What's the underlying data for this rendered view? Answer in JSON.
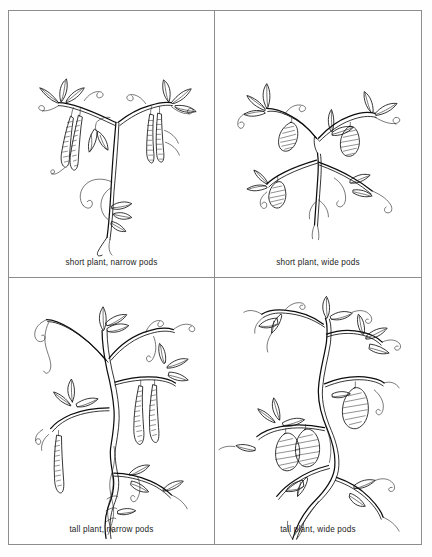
{
  "figure": {
    "background_color": "#ffffff",
    "ink_color": "#111111",
    "border_color": "#8d8d8d",
    "layout": "2x2 grid of framed panels"
  },
  "panels": [
    {
      "id": "short-narrow",
      "caption": "short plant, narrow pods",
      "height_trait": "short",
      "pod_trait": "narrow",
      "illustration": "pen-and-ink drawing of a short pea plant bearing long slender pods, compound leaves and curling tendrils",
      "position": "top-left"
    },
    {
      "id": "short-wide",
      "caption": "short plant, wide pods",
      "height_trait": "short",
      "pod_trait": "wide",
      "illustration": "pen-and-ink drawing of a short sprawling pea plant bearing short broad pods, compound leaves and curling tendrils",
      "position": "top-right"
    },
    {
      "id": "tall-narrow",
      "caption": "tall plant, narrow pods",
      "height_trait": "tall",
      "pod_trait": "narrow",
      "illustration": "pen-and-ink drawing of a tall pea plant with a twisted braided stem bearing long slender pods, compound leaves and curling tendrils",
      "position": "bottom-left"
    },
    {
      "id": "tall-wide",
      "caption": "tall plant, wide pods",
      "height_trait": "tall",
      "pod_trait": "wide",
      "illustration": "pen-and-ink drawing of a tall pea plant with a twisted braided stem bearing short broad pods, compound leaves and curling tendrils",
      "position": "bottom-right"
    }
  ]
}
